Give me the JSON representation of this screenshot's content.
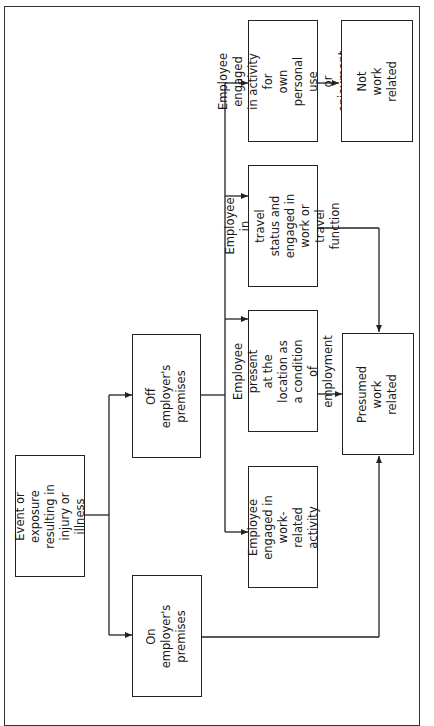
{
  "diagram": {
    "orientation": "rotated-90-ccw",
    "nodes": {
      "event": {
        "label": "Event or exposure\nresulting in\ninjury or illness"
      },
      "on_premises": {
        "label": "On\nemployer's\npremises"
      },
      "off_premises": {
        "label": "Off\nemployer's\npremises"
      },
      "work_related_activity": {
        "label": "Employee\nengaged in\nwork-related\nactivity"
      },
      "condition_of_employment": {
        "label": "Employee present\nat the location as\na condition\nof employment"
      },
      "travel_status": {
        "label": "Employee in\ntravel status and\nengaged in work or\ntravel function"
      },
      "personal_use": {
        "label": "Employee engaged\nin activity for\nown personal use\nor enjoyment"
      },
      "presumed_work_related": {
        "label": "Presumed\nwork\nrelated"
      },
      "not_work_related": {
        "label": "Not\nwork\nrelated"
      }
    },
    "edges": [
      [
        "event",
        "on_premises"
      ],
      [
        "event",
        "off_premises"
      ],
      [
        "off_premises",
        "work_related_activity"
      ],
      [
        "off_premises",
        "condition_of_employment"
      ],
      [
        "off_premises",
        "travel_status"
      ],
      [
        "off_premises",
        "personal_use"
      ],
      [
        "on_premises",
        "presumed_work_related"
      ],
      [
        "condition_of_employment",
        "presumed_work_related"
      ],
      [
        "travel_status",
        "presumed_work_related"
      ],
      [
        "personal_use",
        "not_work_related"
      ]
    ],
    "colors": {
      "line": "#222222",
      "background": "#ffffff"
    }
  }
}
